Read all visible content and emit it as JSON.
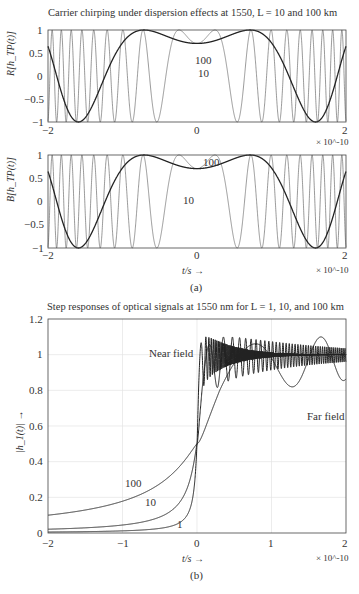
{
  "figure_a": {
    "title": "Carrier chirping under dispersion effects at 1550, L = 10 and 100 km",
    "top_ylabel": "R[h_TP(t)]",
    "bottom_ylabel": "B[h_TP(t)]",
    "xlabel": "t/s →",
    "x_scale": "× 10^-10",
    "caption": "(a)",
    "top_curve_labels": [
      "100",
      "10"
    ],
    "bottom_curve_labels": [
      "100",
      "10"
    ]
  },
  "figure_b": {
    "title": "Step responses of optical signals at 1550 nm for L = 1, 10, and 100 km",
    "ylabel": "|h_1(t)| →",
    "xlabel": "t/s →",
    "x_scale": "× 10^-10",
    "caption": "(b)",
    "annotations": [
      "Near field",
      "Far field"
    ],
    "curve_labels": [
      "100",
      "10",
      "1"
    ]
  },
  "chart_data": [
    {
      "type": "line",
      "title": "Carrier chirping under dispersion effects at 1550, L = 10 and 100 km (real part)",
      "xlabel": "t/s",
      "ylabel": "R[h_TP(t)]",
      "x_ticks": [
        "-2",
        "0",
        "2"
      ],
      "y_ticks": [
        "-1",
        "-0.5",
        "0",
        "0.5",
        "1"
      ],
      "xlim": [
        -2e-10,
        2e-10
      ],
      "ylim": [
        -1,
        1
      ],
      "series": [
        {
          "name": "100",
          "description": "slow chirp, cos(a t^2 + phi), value ~0.7 at t=0, peaks at ±0.6e-10 and ±1.75e-10"
        },
        {
          "name": "10",
          "description": "fast chirp, oscillation frequency increases with |t|"
        }
      ]
    },
    {
      "type": "line",
      "title": "Carrier chirping (imaginary part)",
      "xlabel": "t/s",
      "ylabel": "B[h_TP(t)]",
      "x_ticks": [
        "-2",
        "0",
        "2"
      ],
      "y_ticks": [
        "-1",
        "-0.5",
        "0",
        "0.5",
        "1"
      ],
      "xlim": [
        -2e-10,
        2e-10
      ],
      "ylim": [
        -1,
        1
      ],
      "series": [
        {
          "name": "100",
          "description": "slow chirp, ~0.7 at t=0, minima at ±0.95e-10, peaks at ±1.55e-10"
        },
        {
          "name": "10",
          "description": "fast chirp"
        }
      ]
    },
    {
      "type": "line",
      "title": "Step responses of optical signals at 1550 nm for L = 1, 10, and 100 km",
      "xlabel": "t/s",
      "ylabel": "|h_1(t)|",
      "x_ticks": [
        "-2",
        "-1",
        "0",
        "1",
        "2"
      ],
      "y_ticks": [
        "0",
        "0.2",
        "0.4",
        "0.6",
        "0.8",
        "1",
        "1.2"
      ],
      "xlim": [
        -2e-10,
        2e-10
      ],
      "ylim": [
        0,
        1.2
      ],
      "grid": true,
      "series": [
        {
          "name": "1",
          "x": [
            -2,
            -1,
            -0.5,
            -0.2,
            0,
            0.05,
            0.2,
            0.5,
            1,
            2
          ],
          "values": [
            0.01,
            0.02,
            0.03,
            0.08,
            0.5,
            1.15,
            1.05,
            1.0,
            1.0,
            1.0
          ]
        },
        {
          "name": "10",
          "x": [
            -2,
            -1,
            -0.5,
            -0.2,
            0,
            0.1,
            0.25,
            0.5,
            1,
            2
          ],
          "values": [
            0.03,
            0.06,
            0.1,
            0.2,
            0.5,
            0.9,
            1.17,
            1.0,
            1.02,
            1.0
          ]
        },
        {
          "name": "100",
          "x": [
            -2,
            -1,
            -0.5,
            0,
            0.5,
            1,
            1.5,
            2
          ],
          "values": [
            0.09,
            0.18,
            0.3,
            0.5,
            0.98,
            1.17,
            0.88,
            1.1
          ]
        }
      ]
    }
  ]
}
